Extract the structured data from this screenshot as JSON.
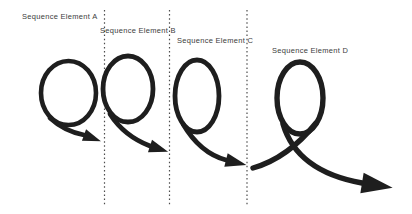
{
  "diagram": {
    "background": "#ffffff",
    "colors": {
      "stroke": "#1e1e1e",
      "divider": "#4d4d4d",
      "text": "#3d3d3d"
    },
    "labels": [
      {
        "text": "Sequence Element A",
        "x": 22,
        "y": 12
      },
      {
        "text": "Sequence Element B",
        "x": 100,
        "y": 26
      },
      {
        "text": "Sequence Element C",
        "x": 177,
        "y": 36
      },
      {
        "text": "Sequence Element D",
        "x": 272,
        "y": 46
      }
    ],
    "dividers": [
      {
        "x": 104.5,
        "y1": 10,
        "y2": 205
      },
      {
        "x": 169.5,
        "y1": 10,
        "y2": 205
      },
      {
        "x": 247.0,
        "y1": 10,
        "y2": 205
      }
    ],
    "spirals": [
      {
        "name": "loop-arrow-a",
        "stroke_width": 4.6,
        "ellipse": {
          "cx": 68.5,
          "cy": 93,
          "rx": 27.5,
          "ry": 32
        },
        "tail": null,
        "exit": "M 50 118 Q 64 131 84 135",
        "arrow": {
          "x": 84,
          "y": 135,
          "angle": 20,
          "len": 18,
          "hw": 6
        }
      },
      {
        "name": "loop-arrow-b",
        "stroke_width": 4.8,
        "ellipse": {
          "cx": 128,
          "cy": 89,
          "rx": 25,
          "ry": 33
        },
        "tail": null,
        "exit": "M 110 114 Q 124 136 150 146",
        "arrow": {
          "x": 150,
          "y": 146,
          "angle": 18,
          "len": 19,
          "hw": 6.5
        }
      },
      {
        "name": "loop-arrow-c",
        "stroke_width": 4.8,
        "ellipse": {
          "cx": 197,
          "cy": 96,
          "rx": 22,
          "ry": 36
        },
        "tail": null,
        "exit": "M 183 124 Q 200 153 226 160",
        "arrow": {
          "x": 226,
          "y": 160,
          "angle": 14,
          "len": 21,
          "hw": 7
        }
      },
      {
        "name": "loop-arrow-d",
        "stroke_width": 5.4,
        "ellipse": {
          "cx": 300,
          "cy": 98,
          "rx": 23,
          "ry": 36
        },
        "tail": "M 253 168 Q 288 158 316 123",
        "exit": "M 283 124 C 293 158 323 176 362 183",
        "arrow": {
          "x": 362,
          "y": 183,
          "angle": 9,
          "len": 31,
          "hw": 10.5
        }
      }
    ]
  }
}
